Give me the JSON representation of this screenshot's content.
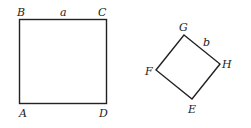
{
  "figure": {
    "square1": {
      "vertices": {
        "A": "A",
        "B": "B",
        "C": "C",
        "D": "D"
      },
      "side_label": "a"
    },
    "square2": {
      "vertices": {
        "E": "E",
        "F": "F",
        "G": "G",
        "H": "H"
      },
      "side_label": "b"
    }
  }
}
